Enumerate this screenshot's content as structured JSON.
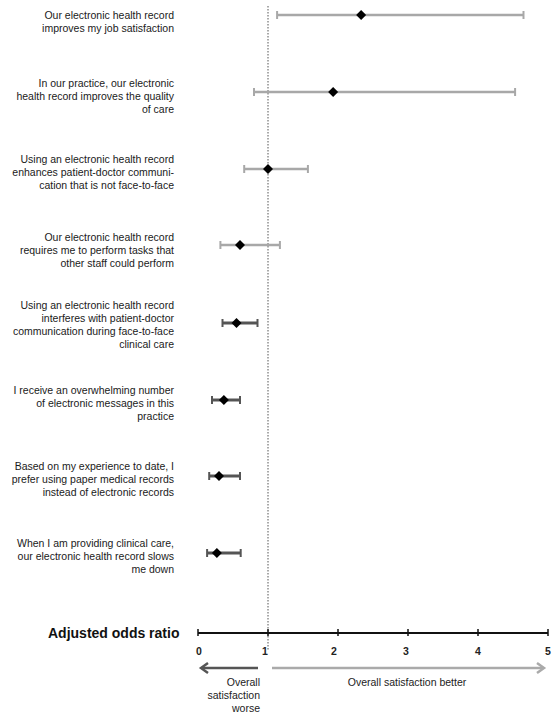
{
  "chart_data": {
    "type": "forest",
    "title": "",
    "xlabel": "Adjusted odds ratio",
    "xlim": [
      0,
      5
    ],
    "xticks": [
      "0",
      "1",
      "2",
      "3",
      "4",
      "5"
    ],
    "reference_line": 1,
    "annotations": {
      "left_arrow": "Overall satisfaction worse",
      "right_arrow": "Overall satisfaction better"
    },
    "rows": [
      {
        "label": "Our electronic health record improves my job satisfaction",
        "or": 2.33,
        "ci_low": 1.13,
        "ci_high": 4.65,
        "color": "#a8a8a8"
      },
      {
        "label": "In our practice, our electronic health record improves the quality of care",
        "or": 1.93,
        "ci_low": 0.8,
        "ci_high": 4.53,
        "color": "#a8a8a8"
      },
      {
        "label": "Using an electronic health record enhances patient-doctor communication that is not face-to-face",
        "or": 1.0,
        "ci_low": 0.66,
        "ci_high": 1.57,
        "color": "#a8a8a8"
      },
      {
        "label": "Our electronic health record requires me to perform tasks that other staff could perform",
        "or": 0.6,
        "ci_low": 0.32,
        "ci_high": 1.17,
        "color": "#a8a8a8"
      },
      {
        "label": "Using an electronic health record interferes with patient-doctor communication during face-to-face clinical care",
        "or": 0.55,
        "ci_low": 0.35,
        "ci_high": 0.85,
        "color": "#555555"
      },
      {
        "label": "I receive an overwhelming number of electronic messages in this practice",
        "or": 0.37,
        "ci_low": 0.2,
        "ci_high": 0.6,
        "color": "#555555"
      },
      {
        "label": "Based on my experience to date, I prefer using paper medical records instead of electronic records",
        "or": 0.3,
        "ci_low": 0.16,
        "ci_high": 0.6,
        "color": "#555555"
      },
      {
        "label": "When I am providing clinical care, our electronic health record slows me down",
        "or": 0.27,
        "ci_low": 0.13,
        "ci_high": 0.61,
        "color": "#555555"
      }
    ]
  },
  "labels": {
    "r0": [
      "Our electronic health record",
      "improves my job satisfaction"
    ],
    "r1": [
      "In our practice, our electronic",
      "health record improves the quality",
      "of care"
    ],
    "r2": [
      "Using an electronic health record",
      "enhances patient-doctor communi-",
      "cation that is not face-to-face"
    ],
    "r3": [
      "Our electronic health record",
      "requires me to perform tasks that",
      "other staff could perform"
    ],
    "r4": [
      "Using an electronic health record",
      "interferes with patient-doctor",
      "communication during face-to-face",
      "clinical care"
    ],
    "r5": [
      "I receive an overwhelming number",
      "of electronic messages in this",
      "practice"
    ],
    "r6": [
      "Based on my experience to date, I",
      "prefer using paper medical records",
      "instead of electronic records"
    ],
    "r7": [
      "When I am providing clinical care,",
      "our electronic health record slows",
      "me down"
    ]
  },
  "axis": {
    "title": "Adjusted odds ratio",
    "ticks": [
      "0",
      "1",
      "2",
      "3",
      "4",
      "5"
    ],
    "worse_label": [
      "Overall",
      "satisfaction",
      "worse"
    ],
    "better_label": "Overall satisfaction better"
  }
}
